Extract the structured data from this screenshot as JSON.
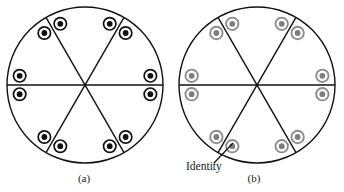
{
  "figure": {
    "title": "",
    "background": "#ffffff",
    "width": 344,
    "height": 192
  },
  "panels": [
    {
      "id": "a",
      "caption": "(a)",
      "caption_x": 84,
      "caption_y": 182,
      "circle": {
        "cx": 85,
        "cy": 85,
        "r": 78
      },
      "outline_color": "#111111",
      "outline_width": 1.4,
      "divider_color": "#111111",
      "divider_width": 1.4,
      "divider_angles_deg": [
        0,
        60,
        120
      ],
      "marker": {
        "style": "black-ring-dot",
        "outer_r": 6.2,
        "outer_color": "#111111",
        "outer_width": 1.7,
        "gap_color": "#ffffff",
        "inner_r": 2.9,
        "inner_color": "#111111"
      },
      "marker_radius_from_center": 66,
      "marker_angles_deg": [
        8,
        52,
        68,
        112,
        128,
        172,
        188,
        232,
        248,
        292,
        308,
        352
      ],
      "marker_count": 12
    },
    {
      "id": "b",
      "caption": "(b)",
      "caption_x": 254,
      "caption_y": 182,
      "circle": {
        "cx": 257,
        "cy": 85,
        "r": 78
      },
      "outline_color": "#111111",
      "outline_width": 1.4,
      "divider_color": "#111111",
      "divider_width": 1.4,
      "divider_angles_deg": [
        0,
        60,
        120
      ],
      "marker": {
        "style": "gray-ring-dot",
        "outer_r": 6.2,
        "outer_color": "#8c8c8c",
        "outer_width": 1.9,
        "gap_color": "#ffffff",
        "inner_r": 2.9,
        "inner_color": "#7d7d7d"
      },
      "marker_radius_from_center": 66,
      "marker_angles_deg": [
        8,
        52,
        68,
        112,
        128,
        172,
        188,
        232,
        248,
        292,
        308,
        352
      ],
      "marker_count": 12,
      "annotation": {
        "label": "Identity",
        "text_x": 186,
        "text_y": 170,
        "leader_from": {
          "x": 214,
          "y": 163
        },
        "leader_to": {
          "x": 233,
          "y": 143
        },
        "leader_color": "#111111",
        "leader_width": 1.2
      }
    }
  ]
}
